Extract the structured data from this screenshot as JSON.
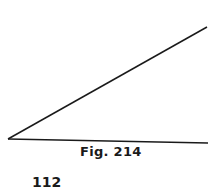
{
  "figure": {
    "caption": "Fig. 214",
    "vertex": [
      8,
      139
    ],
    "upper_ray_end": [
      207,
      27
    ],
    "lower_ray_end": [
      208,
      143
    ],
    "line_color": "#1a1a1a"
  },
  "page": {
    "number": "112"
  }
}
